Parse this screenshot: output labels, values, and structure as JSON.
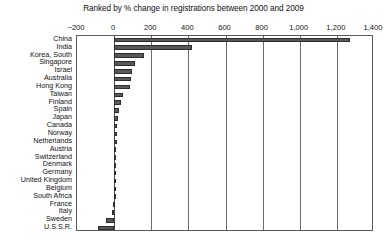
{
  "chart_data": {
    "type": "bar",
    "orientation": "horizontal",
    "title": "Ranked by % change in registrations between 2000 and 2009",
    "xlabel": "",
    "ylabel": "",
    "xlim": [
      -200,
      1400
    ],
    "xticks": [
      -200,
      0,
      200,
      400,
      600,
      800,
      1000,
      1200,
      1400
    ],
    "xtick_labels": [
      "−200",
      "0",
      "200",
      "400",
      "600",
      "800",
      "1,000",
      "1,200",
      "1,400"
    ],
    "grid": true,
    "legend": null,
    "bar_color": "#595959",
    "bar_edge_color": "#2e2e2e",
    "categories": [
      "China",
      "India",
      "Korea, South",
      "Singapore",
      "Israel",
      "Australia",
      "Hong Kong",
      "Taiwan",
      "Finland",
      "Spain",
      "Japan",
      "Canada",
      "Norway",
      "Netherlands",
      "Austria",
      "Switzerland",
      "Denmark",
      "Germany",
      "United Kingdom",
      "Belgium",
      "South Africa",
      "France",
      "Italy",
      "Sweden",
      "U.S.S.R."
    ],
    "values": [
      1270,
      420,
      160,
      113,
      95,
      90,
      88,
      50,
      38,
      25,
      22,
      18,
      16,
      14,
      12,
      10,
      8,
      6,
      5,
      4,
      2,
      -4,
      -10,
      -45,
      -85
    ]
  }
}
